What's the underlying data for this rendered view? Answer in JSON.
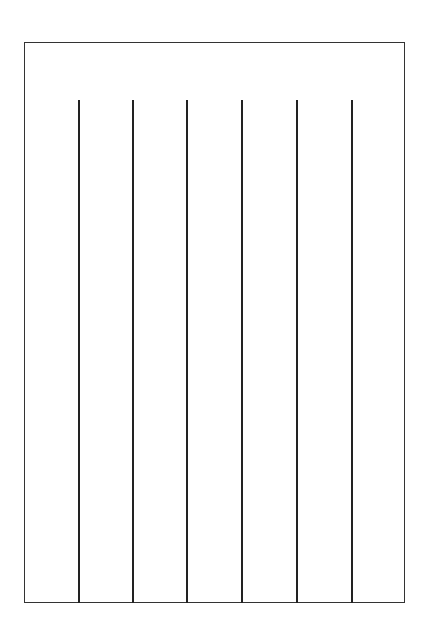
{
  "diagram": {
    "frame": {
      "left": 24,
      "top": 42,
      "right": 405,
      "bottom": 603,
      "color": "#333333"
    },
    "dividers": {
      "top": 100,
      "bottom": 603,
      "color": "#222222",
      "x_positions": [
        78,
        132,
        186,
        241,
        296,
        351
      ]
    }
  }
}
